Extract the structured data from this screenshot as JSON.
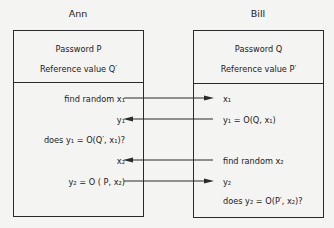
{
  "parties": {
    "left": {
      "name": "Ann",
      "header": [
        "Password  P",
        "Reference value Q′"
      ],
      "steps": {
        "s1": "find random x₁",
        "s2": "y₁",
        "s3": "does y₁ = O(Q′, x₁)?",
        "s4": "x₂",
        "s5": "y₂ = O ( P, x₂)"
      }
    },
    "right": {
      "name": "Bill",
      "header": [
        "Password  Q",
        "Reference value P′"
      ],
      "steps": {
        "s1": "x₁",
        "s2": "y₁ = O(Q, x₁)",
        "s3": "find random x₂",
        "s4": "y₂",
        "s5": "does y₂ = O(P′, x₂)?"
      }
    }
  },
  "arrows": [
    {
      "from": "Ann",
      "to": "Bill",
      "label": "x₁"
    },
    {
      "from": "Bill",
      "to": "Ann",
      "label": "y₁"
    },
    {
      "from": "Bill",
      "to": "Ann",
      "label": "x₂"
    },
    {
      "from": "Ann",
      "to": "Bill",
      "label": "y₂"
    }
  ]
}
